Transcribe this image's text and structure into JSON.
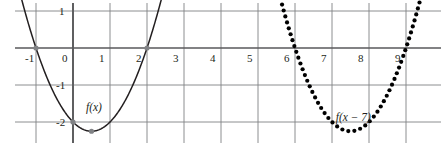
{
  "chart_data": {
    "type": "line",
    "title": "",
    "xlabel": "",
    "ylabel": "",
    "xlim": [
      -1.6,
      9.9
    ],
    "ylim": [
      -2.55,
      1.3
    ],
    "grid": true,
    "legend": "none",
    "x_ticks": [
      -1,
      0,
      1,
      2,
      3,
      4,
      5,
      6,
      7,
      8,
      9
    ],
    "x_tick_labels": [
      "-1",
      "0",
      "1",
      "2",
      "3",
      "4",
      "5",
      "6",
      "7",
      "8",
      "9"
    ],
    "y_ticks": [
      1,
      -1,
      -2
    ],
    "y_tick_labels": [
      "1",
      "-1",
      "-2"
    ],
    "series": [
      {
        "name": "f(x)",
        "label": "f(x)",
        "style": "solid",
        "color": "#231f20",
        "equation": "x^2 - x - 2",
        "vertex": [
          0.5,
          -2.25
        ],
        "roots": [
          -1,
          2
        ],
        "y_intercept": -2,
        "x_domain": [
          -1.45,
          2.45
        ],
        "markers": [
          {
            "x": -1,
            "y": 0
          },
          {
            "x": 0,
            "y": -2
          },
          {
            "x": 0.5,
            "y": -2.25
          },
          {
            "x": 2,
            "y": 0
          }
        ],
        "marker_color": "#808285"
      },
      {
        "name": "f(x-7)",
        "label": "f(x − 7)",
        "style": "dotted",
        "color": "#000000",
        "equation": "(x-7)^2 - (x-7) - 2",
        "vertex": [
          7.5,
          -2.25
        ],
        "roots": [
          6,
          9
        ],
        "x_domain": [
          5.65,
          9.5
        ],
        "markers": [],
        "marker_color": "#000000"
      }
    ],
    "annotations": [
      {
        "text": "f(x)",
        "x": 0.35,
        "y": -1.45
      },
      {
        "text": "f(x − 7)",
        "x": 7.1,
        "y": -1.72
      }
    ]
  },
  "axis_ticks": {
    "x": [
      {
        "label": "-1",
        "value": -1
      },
      {
        "label": "0",
        "value": 0
      },
      {
        "label": "1",
        "value": 1
      },
      {
        "label": "2",
        "value": 2
      },
      {
        "label": "3",
        "value": 3
      },
      {
        "label": "4",
        "value": 4
      },
      {
        "label": "5",
        "value": 5
      },
      {
        "label": "6",
        "value": 6
      },
      {
        "label": "7",
        "value": 7
      },
      {
        "label": "8",
        "value": 8
      },
      {
        "label": "9",
        "value": 9
      }
    ],
    "y": [
      {
        "label": "1",
        "value": 1
      },
      {
        "label": "-1",
        "value": -1
      },
      {
        "label": "-2",
        "value": -2
      }
    ]
  },
  "labels": {
    "f_of_x": "f(x)",
    "f_of_x_minus_7": "f(x − 7)"
  },
  "colors": {
    "curve_solid": "#231f20",
    "curve_dotted": "#000000",
    "grid": "#808285",
    "axis": "#58595b",
    "marker": "#808285",
    "text": "#231f20",
    "background": "#ffffff"
  }
}
